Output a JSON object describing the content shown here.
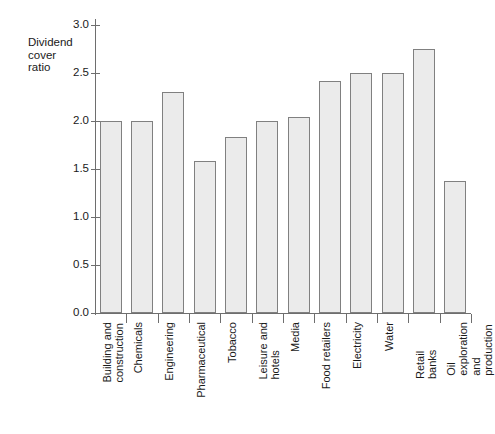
{
  "chart_data": {
    "type": "bar",
    "title": "",
    "ylabel": "Dividend\ncover\nratio",
    "xlabel": "",
    "ylim": [
      0.0,
      3.0
    ],
    "ytick_labels": [
      "0.0",
      "0.5",
      "1.0",
      "1.5",
      "2.0",
      "2.5",
      "3.0"
    ],
    "ytick_values": [
      0.0,
      0.5,
      1.0,
      1.5,
      2.0,
      2.5,
      3.0
    ],
    "grid": false,
    "legend": "none",
    "bar_fill_color": "#ebebeb",
    "bar_edge_color": "#808080",
    "axis_color": "#6e6e6e",
    "categories": [
      "Building and\nconstruction",
      "Chemicals",
      "Engineering",
      "Pharmaceutical",
      "Tobacco",
      "Leisure and\nhotels",
      "Media",
      "Food retailers",
      "Electricity",
      "Water",
      "Retail banks",
      "Oil exploration\nand production"
    ],
    "values": [
      2.0,
      2.0,
      2.3,
      1.58,
      1.83,
      2.0,
      2.04,
      2.42,
      2.5,
      2.5,
      2.75,
      1.37
    ]
  }
}
